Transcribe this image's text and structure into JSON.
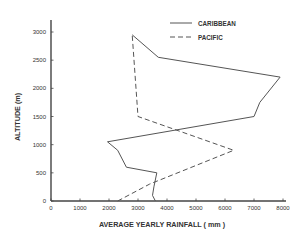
{
  "chart_data": {
    "type": "line",
    "title": "",
    "xlabel": "AVERAGE  YEARLY RAINFALL ( mm )",
    "ylabel": "ALTITUDE (m)",
    "xlim": [
      0,
      8000
    ],
    "ylim": [
      0,
      3000
    ],
    "x_ticks": [
      0,
      1000,
      2000,
      3000,
      4000,
      5000,
      6000,
      7000,
      8000
    ],
    "x_tick_labels": [
      "0",
      "1000",
      "2000",
      "3000",
      "4000",
      "5000",
      "6000",
      "7000",
      "8000"
    ],
    "y_ticks": [
      0,
      500,
      1000,
      1500,
      2000,
      2500,
      3000
    ],
    "y_tick_labels": [
      "0",
      "500",
      "1000",
      "1500",
      "2000",
      "2500",
      "3000"
    ],
    "grid": false,
    "legend_position": "upper right",
    "orientation": "x = rainfall, y = altitude",
    "series": [
      {
        "name": "CARIBBEAN",
        "style": "solid",
        "color": "#555555",
        "points": [
          {
            "rainfall": 3600,
            "altitude": 0
          },
          {
            "rainfall": 3500,
            "altitude": 100
          },
          {
            "rainfall": 3550,
            "altitude": 250
          },
          {
            "rainfall": 3650,
            "altitude": 500
          },
          {
            "rainfall": 2600,
            "altitude": 600
          },
          {
            "rainfall": 2300,
            "altitude": 900
          },
          {
            "rainfall": 1950,
            "altitude": 1050
          },
          {
            "rainfall": 7000,
            "altitude": 1500
          },
          {
            "rainfall": 7200,
            "altitude": 1750
          },
          {
            "rainfall": 7900,
            "altitude": 2200
          },
          {
            "rainfall": 3700,
            "altitude": 2550
          },
          {
            "rainfall": 2800,
            "altitude": 2950
          }
        ]
      },
      {
        "name": "PACIFIC",
        "style": "dashed",
        "color": "#555555",
        "points": [
          {
            "rainfall": 2300,
            "altitude": 0
          },
          {
            "rainfall": 3400,
            "altitude": 300
          },
          {
            "rainfall": 6300,
            "altitude": 900
          },
          {
            "rainfall": 3000,
            "altitude": 1500
          },
          {
            "rainfall": 2800,
            "altitude": 2950
          }
        ]
      }
    ]
  },
  "legend": {
    "items": [
      {
        "label": "CARIBBEAN",
        "style": "solid"
      },
      {
        "label": "PACIFIC",
        "style": "dashed"
      }
    ]
  },
  "colors": {
    "axis": "#444444",
    "line": "#555555",
    "text": "#333333",
    "background": "#ffffff"
  }
}
